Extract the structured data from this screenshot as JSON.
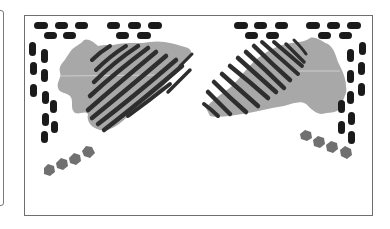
{
  "figure": {
    "colors": {
      "dash": "#1a1a1a",
      "stripe": "#2e2e2e",
      "blob": "#a8a8a8",
      "blotch": "#707070",
      "frame": "#6e6e6e",
      "background": "#ffffff"
    },
    "motifs": [
      {
        "name": "left-motif",
        "dash_rows": 2,
        "dash_columns": 2,
        "stripes": 11,
        "blotches": 4
      },
      {
        "name": "right-motif",
        "dash_rows": 2,
        "dash_columns": 2,
        "stripes": 12,
        "blotches": 4
      }
    ]
  }
}
